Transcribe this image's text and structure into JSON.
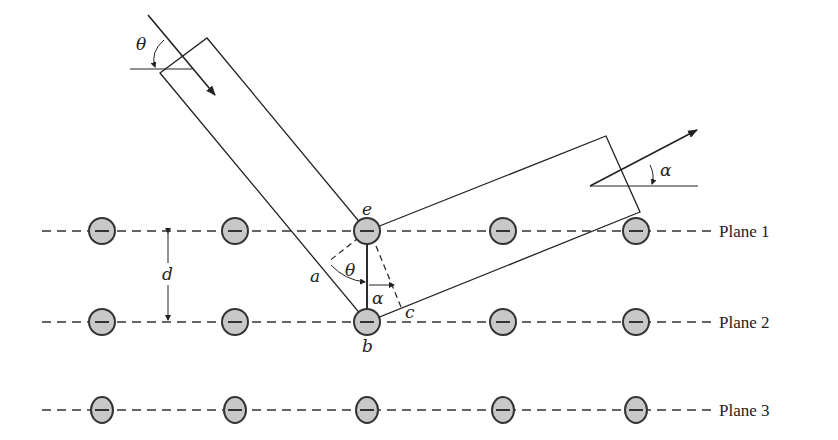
{
  "figure": {
    "planes": [
      {
        "label": "Plane 1",
        "y": 231,
        "atoms_x": [
          102,
          235,
          367,
          503,
          636
        ]
      },
      {
        "label": "Plane 2",
        "y": 322,
        "atoms_x": [
          102,
          235,
          367,
          503,
          636
        ]
      },
      {
        "label": "Plane 3",
        "y": 410,
        "atoms_x": [
          102,
          235,
          367,
          503,
          636
        ]
      }
    ],
    "labels": {
      "theta_incident": "θ",
      "alpha_outgoing": "α",
      "spacing": "d",
      "point_e": "e",
      "point_b": "b",
      "point_a": "a",
      "point_c": "c",
      "theta_inner": "θ",
      "alpha_inner": "α"
    },
    "colors": {
      "line": "#222222",
      "atom_fill": "#c8c8c8",
      "atom_stroke": "#333333",
      "background": "#ffffff"
    }
  }
}
